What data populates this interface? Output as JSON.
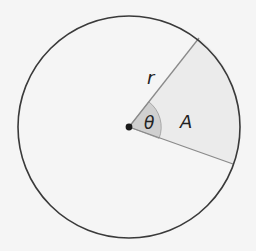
{
  "diagram": {
    "labels": {
      "radius": "r",
      "angle": "θ",
      "area": "A"
    },
    "colors": {
      "background": "#f5f5f5",
      "circle_stroke": "#3a3a3a",
      "radius_stroke": "#8a8a8a",
      "sector_fill": "#ebebeb",
      "angle_fill": "#d0d0d0",
      "center_dot": "#1a1a1a"
    },
    "geometry": {
      "center": [
        129,
        127
      ],
      "radius": 111,
      "ray_upper_end": [
        199,
        38
      ],
      "ray_lower_end": [
        233,
        164
      ]
    }
  }
}
